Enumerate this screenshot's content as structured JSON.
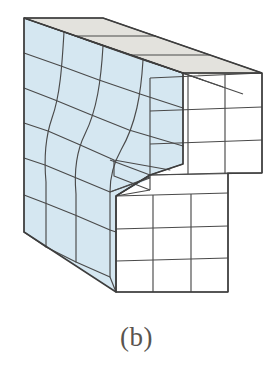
{
  "figure": {
    "caption": "(b)",
    "title": "",
    "type": "3d-deformed-mesh-block",
    "colors": {
      "front_face_fill": "#d5e7f1",
      "top_face_fill": "#e3e2dd",
      "right_face_fill": "#ffffff",
      "mesh_line": "#4a4a4a",
      "outline": "#3d3d3d",
      "caption_text": "#59544f",
      "background": "#ffffff"
    },
    "mesh": {
      "front_face_columns": 4,
      "front_face_rows": 6,
      "top_face_columns": 4,
      "top_face_depth_rows": 3,
      "right_upper_columns": 3,
      "right_upper_rows": 3,
      "right_lower_columns": 3,
      "right_lower_rows": 3
    },
    "faces": [
      {
        "name": "front-left-face",
        "fill": "#d5e7f1",
        "label": "deformed front face"
      },
      {
        "name": "top-face",
        "fill": "#e3e2dd",
        "label": "top face"
      },
      {
        "name": "right-upper-face",
        "fill": "#ffffff",
        "label": "upper right side face"
      },
      {
        "name": "right-lower-face",
        "fill": "#ffffff",
        "label": "lower right side face"
      },
      {
        "name": "step-face",
        "fill": "#d5e7f1",
        "label": "interior step face"
      }
    ]
  }
}
